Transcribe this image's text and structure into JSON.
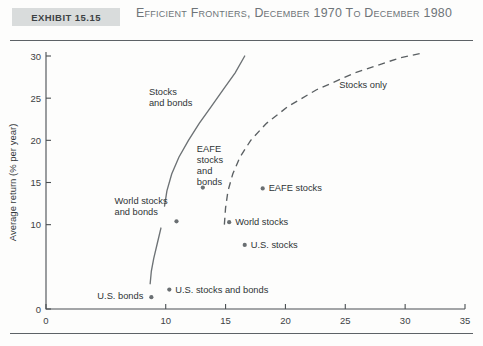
{
  "header": {
    "exhibit_label": "Exhibit 15.15",
    "title": "Efficient Frontiers, December 1970 to December 1980"
  },
  "chart_data": {
    "type": "scatter",
    "title": "Efficient Frontiers, December 1970 to December 1980",
    "xlabel": "Risk (% per year)",
    "ylabel": "Average return (% per year)",
    "xlim": [
      0,
      35
    ],
    "ylim": [
      0,
      30
    ],
    "xticks": [
      0,
      10,
      15,
      20,
      25,
      30,
      35
    ],
    "xticklabels": [
      "0",
      "10",
      "15",
      "20",
      "25",
      "30",
      "35"
    ],
    "yticks": [
      0,
      10,
      15,
      20,
      25,
      30
    ],
    "yticklabels": [
      "0",
      "10",
      "15",
      "20",
      "25",
      "30"
    ],
    "grid": false,
    "legend": "none",
    "points": [
      {
        "label": "U.S. bonds",
        "x": 8.8,
        "y": 1.4,
        "label_dx": -54,
        "label_dy": 2
      },
      {
        "label": "U.S. stocks and bonds",
        "x": 10.3,
        "y": 2.3,
        "label_dx": 6,
        "label_dy": 3
      },
      {
        "label": "U.S. stocks",
        "x": 16.6,
        "y": 7.6,
        "label_dx": 6,
        "label_dy": 3
      },
      {
        "label": "World stocks",
        "x": 15.3,
        "y": 10.3,
        "label_dx": 6,
        "label_dy": 3
      },
      {
        "label": "EAFE stocks",
        "x": 18.1,
        "y": 14.3,
        "label_dx": 6,
        "label_dy": 3
      },
      {
        "label": "World stocks and bonds",
        "x": 10.9,
        "y": 10.4,
        "label_dx": -62,
        "label_dy": -17
      },
      {
        "label": "EAFE stocks and bonds",
        "x": 13.1,
        "y": 14.4,
        "label_dx": -6,
        "label_dy": -36
      }
    ],
    "curves": [
      {
        "name": "Stocks only",
        "style": "dashed",
        "label": "Stocks only",
        "label_x": 24.5,
        "label_y": 26.2,
        "points": [
          [
            14.9,
            10.0
          ],
          [
            15.0,
            12.0
          ],
          [
            15.2,
            14.0
          ],
          [
            15.6,
            16.0
          ],
          [
            16.2,
            18.0
          ],
          [
            17.1,
            20.0
          ],
          [
            18.4,
            22.0
          ],
          [
            20.2,
            24.0
          ],
          [
            22.6,
            26.0
          ],
          [
            25.8,
            28.0
          ],
          [
            29.6,
            29.8
          ],
          [
            31.6,
            30.4
          ]
        ]
      },
      {
        "name": "Stocks and bonds",
        "style": "solid",
        "label": "Stocks and bonds",
        "label_x": 8.6,
        "label_y": 25.4,
        "points": [
          [
            9.9,
            12.2
          ],
          [
            10.1,
            14.0
          ],
          [
            10.5,
            16.0
          ],
          [
            11.1,
            18.0
          ],
          [
            11.9,
            20.0
          ],
          [
            12.8,
            22.0
          ],
          [
            13.8,
            24.0
          ],
          [
            14.8,
            26.0
          ],
          [
            15.8,
            28.0
          ],
          [
            16.6,
            30.0
          ]
        ]
      },
      {
        "name": "World stocks and bonds lower",
        "style": "solid",
        "label": "",
        "points": [
          [
            8.7,
            3.0
          ],
          [
            8.8,
            4.5
          ],
          [
            9.0,
            6.0
          ],
          [
            9.3,
            7.8
          ],
          [
            9.6,
            9.6
          ]
        ]
      }
    ]
  }
}
